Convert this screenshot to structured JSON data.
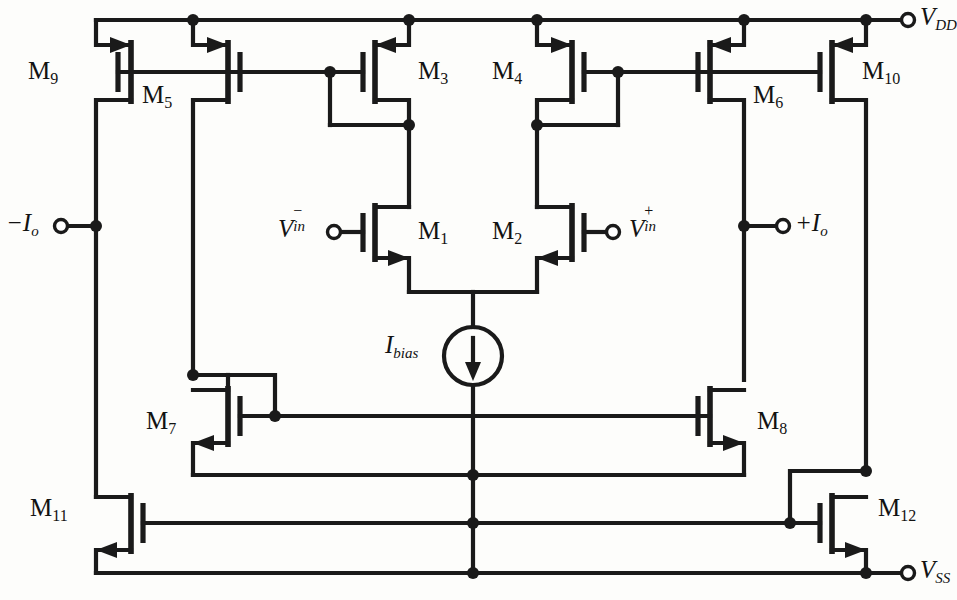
{
  "figure": {
    "kind": "circuit-schematic",
    "background_color": "#fdfdfb",
    "line_color": "#1a1a1a"
  },
  "supply_rails": {
    "positive": {
      "label": "V",
      "sub": "DD",
      "terminal": "open-circle",
      "side": "top-right"
    },
    "negative": {
      "label": "V",
      "sub": "SS",
      "terminal": "open-circle",
      "side": "bottom-right"
    }
  },
  "ports": [
    {
      "id": "minus-io",
      "label": "−I",
      "sub": "o",
      "terminal": "open-circle",
      "side": "left"
    },
    {
      "id": "plus-io",
      "label": "+I",
      "sub": "o",
      "terminal": "open-circle",
      "side": "right"
    },
    {
      "id": "vin-minus",
      "label": "V",
      "sup": "−",
      "sub": "in",
      "terminal": "open-circle",
      "side": "left"
    },
    {
      "id": "vin-plus",
      "label": "V",
      "sup": "+",
      "sub": "in",
      "terminal": "open-circle",
      "side": "right"
    }
  ],
  "sources": [
    {
      "id": "ibias",
      "label": "I",
      "sub": "bias",
      "type": "dc-current-source",
      "direction": "down"
    }
  ],
  "transistors": [
    {
      "id": "M9",
      "name": "M",
      "sub": "9",
      "type": "PMOS",
      "role": "output-mirror-left-top"
    },
    {
      "id": "M5",
      "name": "M",
      "sub": "5",
      "type": "PMOS",
      "role": "mirror-left"
    },
    {
      "id": "M3",
      "name": "M",
      "sub": "3",
      "type": "PMOS",
      "role": "diode-connected-load-left"
    },
    {
      "id": "M4",
      "name": "M",
      "sub": "4",
      "type": "PMOS",
      "role": "diode-connected-load-right"
    },
    {
      "id": "M6",
      "name": "M",
      "sub": "6",
      "type": "PMOS",
      "role": "mirror-right"
    },
    {
      "id": "M10",
      "name": "M",
      "sub": "10",
      "type": "PMOS",
      "role": "output-mirror-right-top"
    },
    {
      "id": "M1",
      "name": "M",
      "sub": "1",
      "type": "NMOS",
      "role": "input-pair-left"
    },
    {
      "id": "M2",
      "name": "M",
      "sub": "2",
      "type": "NMOS",
      "role": "input-pair-right"
    },
    {
      "id": "M7",
      "name": "M",
      "sub": "7",
      "type": "NMOS",
      "role": "diode-connected-mirror-left"
    },
    {
      "id": "M8",
      "name": "M",
      "sub": "8",
      "type": "NMOS",
      "role": "diode-connected-mirror-right"
    },
    {
      "id": "M11",
      "name": "M",
      "sub": "11",
      "type": "NMOS",
      "role": "output-sink-left"
    },
    {
      "id": "M12",
      "name": "M",
      "sub": "12",
      "type": "NMOS",
      "role": "output-sink-right"
    }
  ]
}
